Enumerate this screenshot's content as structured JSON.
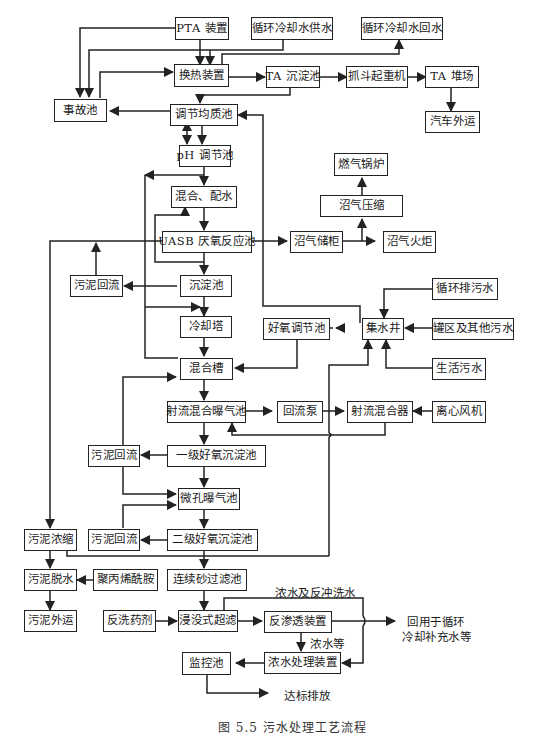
{
  "diagram": {
    "type": "process-flow",
    "nodes": {
      "pta": "PTA 装置",
      "cw_supply": "循环冷却水供水",
      "cw_return": "循环冷却水回水",
      "heat_exchanger": "换热装置",
      "ta_settling": "TA 沉淀池",
      "grab_crane": "抓斗起重机",
      "ta_yard": "TA 堆场",
      "truck_out": "汽车外运",
      "accident_pool": "事故池",
      "equalization": "调节均质池",
      "ph_adjust": "pH 调节池",
      "mix_dose": "混合、配水",
      "gas_boiler": "燃气锅炉",
      "biogas_compress": "沼气压缩",
      "uasb": "UASB 厌氧反应池",
      "biogas_holder": "沼气储柜",
      "biogas_flare": "沼气火炬",
      "sludge_return_1": "污泥回流",
      "settling": "沉淀池",
      "cycle_discharge": "循环排污水",
      "cooling_tower": "冷却塔",
      "aerobic_adjust": "好氧调节池",
      "sump": "集水井",
      "tank_other": "罐区及其他污水",
      "mix_tank": "混合槽",
      "domestic": "生活污水",
      "jet_aeration": "射流混合曝气池",
      "return_pump": "回流泵",
      "jet_mixer": "射流混合器",
      "blower": "离心风机",
      "sludge_return_2": "污泥回流",
      "primary_clarifier": "一级好氧沉淀池",
      "micro_aeration": "微孔曝气池",
      "sludge_thicken": "污泥浓缩",
      "sludge_return_3": "污泥回流",
      "secondary_clarifier": "二级好氧沉淀池",
      "sludge_dewater": "污泥脱水",
      "pam": "聚丙烯酰胺",
      "sand_filter": "连续砂过滤池",
      "sludge_out": "污泥外运",
      "backwash_agent": "反洗药剂",
      "uf": "浸没式超滤",
      "ro": "反渗透装置",
      "conc_treat": "浓水处理装置",
      "monitor_pool": "监控池"
    },
    "labels": {
      "conc_backwash": "浓水及反冲洗水",
      "conc_etc": "浓水等",
      "reuse_line1": "回用于循环",
      "reuse_line2": "冷却补充水等",
      "discharge": "达标排放"
    },
    "caption": "图 5.5  污水处理工艺流程"
  }
}
